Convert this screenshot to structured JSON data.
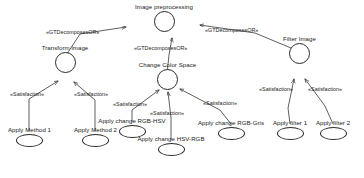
{
  "diagram": {
    "type": "goal-model",
    "stroke_color": "#2a2a2a",
    "text_color": "#1a1a1a",
    "background": "#ffffff"
  },
  "nodes": [
    {
      "id": "image-preprocessing",
      "label": "Image preprocessing",
      "kind": "goal"
    },
    {
      "id": "transform-image",
      "label": "Transform image",
      "kind": "goal"
    },
    {
      "id": "change-color-space",
      "label": "Change Color Space",
      "kind": "goal"
    },
    {
      "id": "filter-image",
      "label": "Filter Image",
      "kind": "goal"
    },
    {
      "id": "apply-method-1",
      "label": "Apply Method 1",
      "kind": "task"
    },
    {
      "id": "apply-method-2",
      "label": "Apply Method 2",
      "kind": "task"
    },
    {
      "id": "apply-change-rgb-hsv",
      "label": "Apply change RGB-HSV",
      "kind": "task"
    },
    {
      "id": "apply-change-hsv-rgb",
      "label": "Apply change HSV-RGB",
      "kind": "task"
    },
    {
      "id": "apply-change-rgb-gris",
      "label": "Apply change RGB-Gris",
      "kind": "task"
    },
    {
      "id": "apply-filter-1",
      "label": "Apply filter 1",
      "kind": "task"
    },
    {
      "id": "apply-filter-2",
      "label": "Apply filter 2",
      "kind": "task"
    }
  ],
  "edges": [
    {
      "id": "e-transform-to-root",
      "from": "transform-image",
      "to": "image-preprocessing",
      "stereotype": "«GTDecomposesOR»"
    },
    {
      "id": "e-color-to-root",
      "from": "change-color-space",
      "to": "image-preprocessing",
      "stereotype": "«GTDecomposesOR»"
    },
    {
      "id": "e-filter-to-root",
      "from": "filter-image",
      "to": "image-preprocessing",
      "stereotype": "«GTDecomposesOR»"
    },
    {
      "id": "e-m1-to-transform",
      "from": "apply-method-1",
      "to": "transform-image",
      "stereotype": "«Satisfaction»"
    },
    {
      "id": "e-m2-to-transform",
      "from": "apply-method-2",
      "to": "transform-image",
      "stereotype": "«Satisfaction»"
    },
    {
      "id": "e-rgbhsv-to-color",
      "from": "apply-change-rgb-hsv",
      "to": "change-color-space",
      "stereotype": "«Satisfaction»"
    },
    {
      "id": "e-hsvrgb-to-color",
      "from": "apply-change-hsv-rgb",
      "to": "change-color-space",
      "stereotype": "«Satisfaction»"
    },
    {
      "id": "e-rgbgris-to-color",
      "from": "apply-change-rgb-gris",
      "to": "change-color-space",
      "stereotype": "«Satisfaction»"
    },
    {
      "id": "e-f1-to-filter",
      "from": "apply-filter-1",
      "to": "filter-image",
      "stereotype": "«Satisfaction»"
    },
    {
      "id": "e-f2-to-filter",
      "from": "apply-filter-2",
      "to": "filter-image",
      "stereotype": "«Satisfaction»"
    }
  ]
}
